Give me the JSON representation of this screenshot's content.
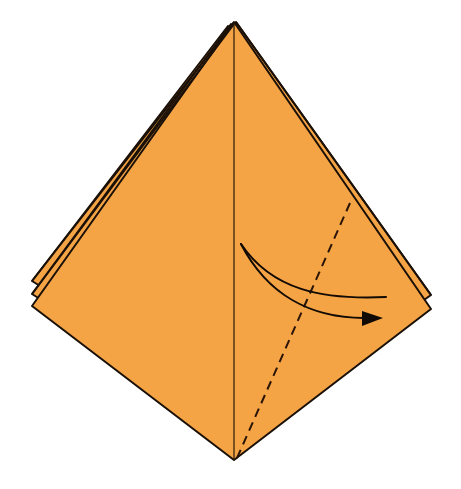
{
  "diagram": {
    "type": "origami-instruction-step",
    "colors": {
      "paper": "#F4A444",
      "outline": "#1a1008",
      "background": "#ffffff"
    },
    "shape": {
      "apex": [
        234,
        22
      ],
      "bottom": [
        234,
        460
      ],
      "left_layers": [
        [
          32,
          281
        ],
        [
          32,
          294
        ],
        [
          32,
          306
        ]
      ],
      "right_layers": [
        [
          431,
          295
        ],
        [
          431,
          309
        ]
      ]
    },
    "center_crease": {
      "from": [
        234,
        22
      ],
      "to": [
        234,
        460
      ]
    },
    "valley_fold_line": {
      "style": "dashed",
      "from": [
        350,
        203
      ],
      "to": [
        237,
        458
      ]
    },
    "fold_arrow": {
      "start": [
        241,
        244
      ],
      "upper_curve_end": [
        386,
        297
      ],
      "head_tip": [
        383,
        318
      ],
      "direction": "right"
    }
  }
}
